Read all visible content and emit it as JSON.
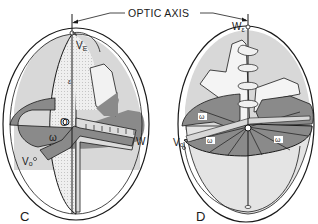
{
  "title": {
    "optic_axis_label": "OPTIC AXIS"
  },
  "figure_c": {
    "panel_label": "C",
    "labels": {
      "v_epsilon": "V",
      "v_epsilon_sub": "E",
      "epsilon": "ε",
      "omega": "ω",
      "origin": "O",
      "w": "W",
      "v_omega": "V",
      "v_omega_sub": "o"
    }
  },
  "figure_d": {
    "panel_label": "D",
    "labels": {
      "w_epsilon": "W",
      "w_epsilon_sub": "ε",
      "omega_left": "ω",
      "omega_center": "ω",
      "omega_right": "ω",
      "v_omega": "V",
      "v_omega_sub": "o"
    }
  },
  "colors": {
    "line": "#1a1a1a",
    "dark_shade": "#8a8a8a",
    "light_shade": "#d6d6d6",
    "stipple_bg": "#e8e8e8",
    "background": "#ffffff"
  }
}
